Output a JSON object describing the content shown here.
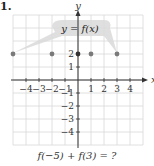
{
  "problem_number": "1.",
  "question": "f(−5) + f(3) = ?",
  "chart_data": {
    "type": "scatter",
    "title": "",
    "function_label": "y = f(x)",
    "xlabel": "x",
    "ylabel": "y",
    "x_ticks": [
      -4,
      -3,
      -2,
      -1,
      1,
      2,
      3,
      4
    ],
    "y_ticks": [
      2,
      1,
      -1,
      -2,
      -3,
      -4
    ],
    "xlim": [
      -5.5,
      4.5
    ],
    "ylim": [
      -5,
      5
    ],
    "grid": true,
    "points": [
      {
        "x": -5,
        "y": 2
      },
      {
        "x": -2,
        "y": 2
      },
      {
        "x": 0,
        "y": 2
      },
      {
        "x": 1,
        "y": 2
      },
      {
        "x": 3,
        "y": 2
      }
    ],
    "colors": {
      "points": "#7a7a7a",
      "grid": "#d8d8d8",
      "axes": "#333333",
      "callout": "#d9d9d9"
    }
  }
}
